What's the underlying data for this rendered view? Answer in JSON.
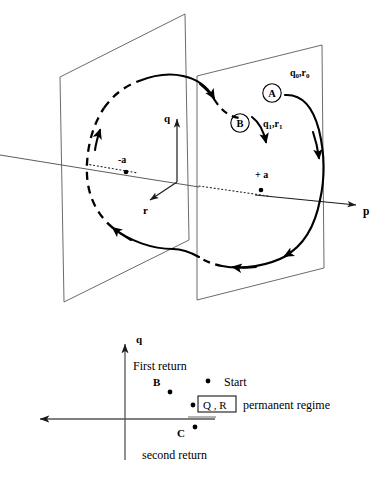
{
  "figure": {
    "upper_panel": {
      "name": "three-dimensional phase space with two transversal planes",
      "axes": [
        {
          "id": "q",
          "label": "q",
          "direction": "up"
        },
        {
          "id": "r",
          "label": "r",
          "direction": "down-left"
        },
        {
          "id": "p",
          "label": "p",
          "direction": "right"
        }
      ],
      "fixed_points": [
        {
          "id": "minus-a",
          "label": "-a"
        },
        {
          "id": "plus-a",
          "label": "+ a"
        }
      ],
      "section_markers": [
        {
          "id": "A",
          "label": "A",
          "coords_label": "q₀,r₀"
        },
        {
          "id": "B",
          "label": "B",
          "coords_label": "q₁,r₁"
        }
      ],
      "coord_labels": {
        "initial": "q₀,r₀",
        "first_return": "q₁,r₁",
        "initial_base": "q",
        "initial_sub_1": "0",
        "initial_sub_2": "0",
        "return_base": "q",
        "return_sub_1": "1",
        "return_sub_2": "1"
      },
      "q0_main": "q",
      "q0_sub": "0",
      "q0_mid": ",r",
      "q0_sub2": "0",
      "q1_main": "q",
      "q1_sub": "1",
      "q1_mid": ",r",
      "q1_sub2": "1"
    },
    "lower_panel": {
      "name": "Poincare return map on the section plane",
      "vertical_axis_label": "q",
      "annotations": [
        {
          "id": "first-return",
          "label": "First return"
        },
        {
          "id": "second-return",
          "label": "second return"
        },
        {
          "id": "permanent-regime",
          "label": "permanent regime"
        }
      ],
      "points": [
        {
          "id": "start",
          "label": "Start",
          "x": 208,
          "y": 381
        },
        {
          "id": "b",
          "label": "B",
          "x": 170,
          "y": 392
        },
        {
          "id": "qr",
          "label": "Q , R",
          "x": 193,
          "y": 405
        },
        {
          "id": "c",
          "label": "C",
          "x": 195,
          "y": 427
        }
      ],
      "boxed_label": "Q , R",
      "point_labels": {
        "start": "Start",
        "b": "B",
        "c": "C"
      }
    }
  },
  "colors": {
    "ink": "#000000",
    "plane_stroke": "#5a5a5a",
    "axis_stroke": "#4a4a4a",
    "background": "#ffffff"
  }
}
